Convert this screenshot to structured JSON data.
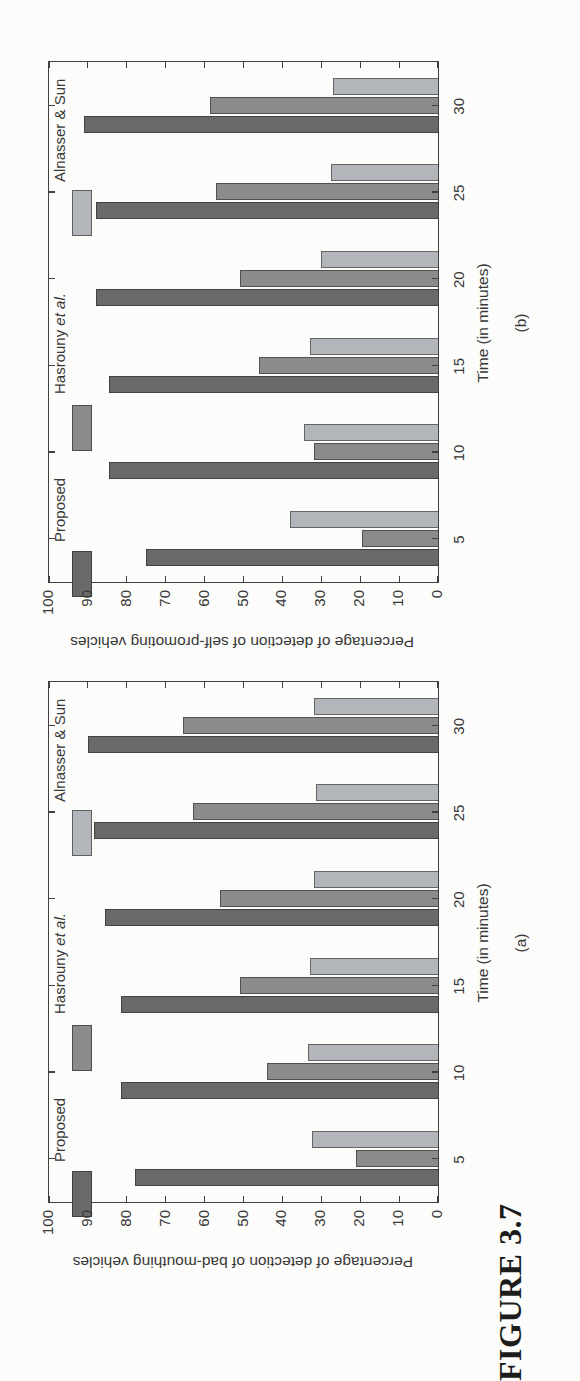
{
  "page": {
    "figure_label": "FIGURE 3.7"
  },
  "colors": {
    "proposed": "#696969",
    "hasrouny": "#8b8b8b",
    "alnasser": "#b2b6ba",
    "axis": "#3f3f3f",
    "text": "#383838"
  },
  "legend": {
    "entries": [
      {
        "label": "Proposed",
        "color_key": "proposed"
      },
      {
        "label": "Hasrouny et al.",
        "color_key": "hasrouny"
      },
      {
        "label": "Alnasser & Sun",
        "color_key": "alnasser"
      }
    ]
  },
  "chart_data": [
    {
      "id": "a",
      "type": "bar",
      "panel_label": "(a)",
      "xlabel": "Time (in minutes)",
      "ylabel": "Percentage of detection of bad-mouthing vehicles",
      "categories": [
        5,
        10,
        15,
        20,
        25,
        30
      ],
      "ylim": [
        0,
        100
      ],
      "yticks": [
        0,
        10,
        20,
        30,
        40,
        50,
        60,
        70,
        80,
        90,
        100
      ],
      "grid": false,
      "legend_position": "top-inside",
      "orientation_on_page": "rotated 90 degrees counter-clockwise",
      "series": [
        {
          "name": "Proposed",
          "values": [
            78,
            81.5,
            81.5,
            85.5,
            88.5,
            90
          ]
        },
        {
          "name": "Hasrouny et al.",
          "values": [
            21,
            44,
            51,
            56,
            63,
            65.5
          ]
        },
        {
          "name": "Alnasser & Sun",
          "values": [
            32.5,
            33.5,
            33,
            32,
            31.5,
            32
          ]
        }
      ]
    },
    {
      "id": "b",
      "type": "bar",
      "panel_label": "(b)",
      "xlabel": "Time (in minutes)",
      "ylabel": "Percentage of detection of self-promoting vehicles",
      "categories": [
        5,
        10,
        15,
        20,
        25,
        30
      ],
      "ylim": [
        0,
        100
      ],
      "yticks": [
        0,
        10,
        20,
        30,
        40,
        50,
        60,
        70,
        80,
        90,
        100
      ],
      "grid": false,
      "legend_position": "top-inside",
      "orientation_on_page": "rotated 90 degrees counter-clockwise",
      "series": [
        {
          "name": "Proposed",
          "values": [
            75,
            84.5,
            84.5,
            88,
            88,
            91
          ]
        },
        {
          "name": "Hasrouny et al.",
          "values": [
            19.5,
            32,
            46,
            51,
            57,
            58.5
          ]
        },
        {
          "name": "Alnasser & Sun",
          "values": [
            38,
            34.5,
            33,
            30,
            27.5,
            27
          ]
        }
      ]
    }
  ]
}
